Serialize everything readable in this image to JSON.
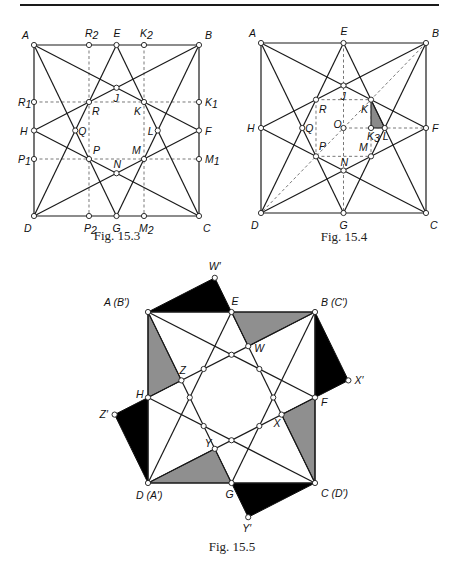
{
  "page": {
    "rule": true
  },
  "figures": [
    {
      "id": "fig-15-3",
      "caption": "Fig. 15.3",
      "caption_pos": [
        117,
        237
      ],
      "square": {
        "x0": 34,
        "y0": 45,
        "x1": 199,
        "y1": 216
      },
      "points": {
        "A": [
          0,
          0
        ],
        "B": [
          1,
          0
        ],
        "C": [
          1,
          1
        ],
        "D": [
          0,
          1
        ],
        "E": [
          0.5,
          0
        ],
        "F": [
          1,
          0.5
        ],
        "G": [
          0.5,
          1
        ],
        "H": [
          0,
          0.5
        ],
        "J": [
          0.5,
          0.25
        ],
        "K": [
          0.6667,
          0.3333
        ],
        "L": [
          0.75,
          0.5
        ],
        "M": [
          0.6667,
          0.6667
        ],
        "N": [
          0.5,
          0.75
        ],
        "P": [
          0.3333,
          0.6667
        ],
        "Q": [
          0.25,
          0.5
        ],
        "R": [
          0.3333,
          0.3333
        ],
        "R1": [
          0,
          0.3333
        ],
        "R2": [
          0.3333,
          0
        ],
        "K1": [
          1,
          0.3333
        ],
        "K2": [
          0.6667,
          0
        ],
        "P1": [
          0,
          0.6667
        ],
        "P2": [
          0.3333,
          1
        ],
        "M1": [
          1,
          0.6667
        ],
        "M2": [
          0.6667,
          1
        ]
      },
      "solid_lines": [
        [
          "A",
          "B"
        ],
        [
          "B",
          "C"
        ],
        [
          "C",
          "D"
        ],
        [
          "D",
          "A"
        ],
        [
          "A",
          "F"
        ],
        [
          "A",
          "G"
        ],
        [
          "B",
          "H"
        ],
        [
          "B",
          "G"
        ],
        [
          "C",
          "E"
        ],
        [
          "C",
          "H"
        ],
        [
          "D",
          "E"
        ],
        [
          "D",
          "F"
        ]
      ],
      "dashed_lines": [
        [
          "R1",
          "K1"
        ],
        [
          "P1",
          "M1"
        ],
        [
          "R2",
          "P2"
        ],
        [
          "K2",
          "M2"
        ]
      ],
      "circles": [
        "A",
        "B",
        "C",
        "D",
        "E",
        "F",
        "G",
        "H",
        "J",
        "K",
        "L",
        "M",
        "N",
        "P",
        "Q",
        "R",
        "R1",
        "R2",
        "K1",
        "K2",
        "P1",
        "P2",
        "M1",
        "M2"
      ],
      "shaded": [],
      "labels": [
        {
          "text": "A",
          "at": "A",
          "dx": -12,
          "dy": -6
        },
        {
          "text": "R",
          "sub": "2",
          "at": "R2",
          "dx": -4,
          "dy": -8
        },
        {
          "text": "E",
          "at": "E",
          "dx": -3,
          "dy": -8
        },
        {
          "text": "K",
          "sub": "2",
          "at": "K2",
          "dx": -4,
          "dy": -8
        },
        {
          "text": "B",
          "at": "B",
          "dx": 6,
          "dy": -6
        },
        {
          "text": "R",
          "sub": "1",
          "at": "R1",
          "dx": -16,
          "dy": 4
        },
        {
          "text": "K",
          "sub": "1",
          "at": "K1",
          "dx": 6,
          "dy": 4
        },
        {
          "text": "H",
          "at": "H",
          "dx": -14,
          "dy": 4
        },
        {
          "text": "F",
          "at": "F",
          "dx": 6,
          "dy": 4
        },
        {
          "text": "P",
          "sub": "1",
          "at": "P1",
          "dx": -16,
          "dy": 4
        },
        {
          "text": "M",
          "sub": "1",
          "at": "M1",
          "dx": 6,
          "dy": 4
        },
        {
          "text": "D",
          "at": "D",
          "dx": -10,
          "dy": 16
        },
        {
          "text": "P",
          "sub": "2",
          "at": "P2",
          "dx": -5,
          "dy": 16
        },
        {
          "text": "G",
          "at": "G",
          "dx": -4,
          "dy": 16
        },
        {
          "text": "M",
          "sub": "2",
          "at": "M2",
          "dx": -5,
          "dy": 16
        },
        {
          "text": "C",
          "at": "C",
          "dx": 4,
          "dy": 16
        },
        {
          "text": "J",
          "at": "J",
          "dx": -3,
          "dy": 14
        },
        {
          "text": "R",
          "at": "R",
          "dx": 3,
          "dy": 13
        },
        {
          "text": "K",
          "at": "K",
          "dx": -10,
          "dy": 13
        },
        {
          "text": "Q",
          "at": "Q",
          "dx": 3,
          "dy": 4
        },
        {
          "text": "L",
          "at": "L",
          "dx": -10,
          "dy": 4
        },
        {
          "text": "P",
          "at": "P",
          "dx": 4,
          "dy": -5
        },
        {
          "text": "M",
          "at": "M",
          "dx": -12,
          "dy": -5
        },
        {
          "text": "N",
          "at": "N",
          "dx": -3,
          "dy": -5
        }
      ]
    },
    {
      "id": "fig-15-4",
      "caption": "Fig. 15.4",
      "caption_pos": [
        344,
        238
      ],
      "square": {
        "x0": 261,
        "y0": 43,
        "x1": 426,
        "y1": 213
      },
      "points": {
        "A": [
          0,
          0
        ],
        "B": [
          1,
          0
        ],
        "C": [
          1,
          1
        ],
        "D": [
          0,
          1
        ],
        "E": [
          0.5,
          0
        ],
        "F": [
          1,
          0.5
        ],
        "G": [
          0.5,
          1
        ],
        "H": [
          0,
          0.5
        ],
        "J": [
          0.5,
          0.25
        ],
        "K": [
          0.6667,
          0.3333
        ],
        "L": [
          0.75,
          0.5
        ],
        "M": [
          0.6667,
          0.6667
        ],
        "N": [
          0.5,
          0.75
        ],
        "P": [
          0.3333,
          0.6667
        ],
        "Q": [
          0.25,
          0.5
        ],
        "R": [
          0.3333,
          0.3333
        ],
        "O": [
          0.5,
          0.5
        ],
        "K3": [
          0.6667,
          0.5
        ]
      },
      "solid_lines": [
        [
          "A",
          "B"
        ],
        [
          "B",
          "C"
        ],
        [
          "C",
          "D"
        ],
        [
          "D",
          "A"
        ],
        [
          "A",
          "F"
        ],
        [
          "A",
          "G"
        ],
        [
          "B",
          "H"
        ],
        [
          "B",
          "G"
        ],
        [
          "C",
          "E"
        ],
        [
          "C",
          "H"
        ],
        [
          "D",
          "E"
        ],
        [
          "D",
          "F"
        ]
      ],
      "dashed_lines": [
        [
          "E",
          "G"
        ],
        [
          "R",
          "K"
        ],
        [
          "R",
          "P"
        ],
        [
          "P",
          "M"
        ],
        [
          "K",
          "M"
        ],
        [
          "O",
          "F"
        ],
        [
          "B",
          "D"
        ]
      ],
      "circles": [
        "A",
        "B",
        "C",
        "D",
        "E",
        "F",
        "G",
        "H",
        "J",
        "K",
        "L",
        "M",
        "N",
        "P",
        "Q",
        "R",
        "O",
        "K3"
      ],
      "shaded": [
        {
          "pts": [
            "K",
            "K3",
            "L"
          ],
          "fill": "#8a8a8a"
        }
      ],
      "labels": [
        {
          "text": "A",
          "at": "A",
          "dx": -12,
          "dy": -6
        },
        {
          "text": "E",
          "at": "E",
          "dx": -3,
          "dy": -8
        },
        {
          "text": "B",
          "at": "B",
          "dx": 6,
          "dy": -6
        },
        {
          "text": "H",
          "at": "H",
          "dx": -14,
          "dy": 4
        },
        {
          "text": "F",
          "at": "F",
          "dx": 6,
          "dy": 4
        },
        {
          "text": "D",
          "at": "D",
          "dx": -10,
          "dy": 16
        },
        {
          "text": "G",
          "at": "G",
          "dx": -4,
          "dy": 16
        },
        {
          "text": "C",
          "at": "C",
          "dx": 4,
          "dy": 16
        },
        {
          "text": "J",
          "at": "J",
          "dx": -3,
          "dy": 14
        },
        {
          "text": "R",
          "at": "R",
          "dx": 3,
          "dy": 13
        },
        {
          "text": "K",
          "at": "K",
          "dx": -10,
          "dy": 13
        },
        {
          "text": "Q",
          "at": "Q",
          "dx": 3,
          "dy": 4
        },
        {
          "text": "O",
          "at": "O",
          "dx": -10,
          "dy": 0
        },
        {
          "text": "K",
          "sub": "3",
          "at": "K3",
          "dx": -4,
          "dy": 12
        },
        {
          "text": "L",
          "at": "L",
          "dx": -2,
          "dy": 12
        },
        {
          "text": "P",
          "at": "P",
          "dx": 3,
          "dy": -6
        },
        {
          "text": "M",
          "at": "M",
          "dx": -12,
          "dy": -5
        },
        {
          "text": "N",
          "at": "N",
          "dx": -3,
          "dy": -5
        }
      ]
    },
    {
      "id": "fig-15-5",
      "caption": "Fig. 15.5",
      "caption_pos": [
        232,
        548
      ],
      "square": {
        "x0": 148,
        "y0": 312,
        "x1": 315,
        "y1": 483
      },
      "points": {
        "A": [
          0,
          0
        ],
        "B": [
          1,
          0
        ],
        "C": [
          1,
          1
        ],
        "D": [
          0,
          1
        ],
        "E": [
          0.5,
          0
        ],
        "F": [
          1,
          0.5
        ],
        "G": [
          0.5,
          1
        ],
        "H": [
          0,
          0.5
        ],
        "J": [
          0.5,
          0.25
        ],
        "K": [
          0.6667,
          0.3333
        ],
        "L": [
          0.75,
          0.5
        ],
        "M": [
          0.6667,
          0.6667
        ],
        "N": [
          0.5,
          0.75
        ],
        "P": [
          0.3333,
          0.6667
        ],
        "Q": [
          0.25,
          0.5
        ],
        "R": [
          0.3333,
          0.3333
        ],
        "W": [
          0.6,
          0.2
        ],
        "X": [
          0.8,
          0.6
        ],
        "Y": [
          0.4,
          0.8
        ],
        "Z": [
          0.2,
          0.4
        ],
        "W2": [
          0.4,
          -0.2
        ],
        "X2": [
          1.2,
          0.4
        ],
        "Y2": [
          0.6,
          1.2
        ],
        "Z2": [
          -0.2,
          0.6
        ]
      },
      "solid_lines": [
        [
          "A",
          "B"
        ],
        [
          "B",
          "C"
        ],
        [
          "C",
          "D"
        ],
        [
          "D",
          "A"
        ],
        [
          "A",
          "F"
        ],
        [
          "A",
          "G"
        ],
        [
          "B",
          "H"
        ],
        [
          "B",
          "G"
        ],
        [
          "C",
          "E"
        ],
        [
          "C",
          "H"
        ],
        [
          "D",
          "E"
        ],
        [
          "D",
          "F"
        ]
      ],
      "dashed_lines": [],
      "circles": [
        "A",
        "B",
        "C",
        "D",
        "E",
        "F",
        "G",
        "H",
        "J",
        "K",
        "L",
        "M",
        "N",
        "P",
        "Q",
        "R",
        "W",
        "X",
        "Y",
        "Z",
        "W2",
        "X2",
        "Y2",
        "Z2"
      ],
      "shaded": [
        {
          "pts": [
            "A",
            "H",
            "Z"
          ],
          "fill": "#8f8f8f"
        },
        {
          "pts": [
            "E",
            "B",
            "W"
          ],
          "fill": "#8f8f8f"
        },
        {
          "pts": [
            "B",
            "F",
            "X"
          ],
          "fill": "#8f8f8f",
          "skip": true
        },
        {
          "pts": [
            "F",
            "C",
            "X"
          ],
          "fill": "#8f8f8f"
        },
        {
          "pts": [
            "G",
            "D",
            "Y"
          ],
          "fill": "#8f8f8f"
        },
        {
          "pts": [
            "A",
            "E",
            "W2"
          ],
          "fill": "#000000"
        },
        {
          "pts": [
            "B",
            "F",
            "X2"
          ],
          "fill": "#000000"
        },
        {
          "pts": [
            "C",
            "G",
            "Y2"
          ],
          "fill": "#000000"
        },
        {
          "pts": [
            "D",
            "H",
            "Z2"
          ],
          "fill": "#000000"
        }
      ],
      "labels": [
        {
          "text": "A  (B′)",
          "at": "A",
          "dx": -44,
          "dy": -6
        },
        {
          "text": "W′",
          "at": "W2",
          "dx": -6,
          "dy": -8
        },
        {
          "text": "E",
          "at": "E",
          "dx": 0,
          "dy": -7
        },
        {
          "text": "B  (C′)",
          "at": "B",
          "dx": 6,
          "dy": -6
        },
        {
          "text": "W",
          "at": "W",
          "dx": 6,
          "dy": 6
        },
        {
          "text": "Z",
          "at": "Z",
          "dx": -2,
          "dy": -6
        },
        {
          "text": "H",
          "at": "H",
          "dx": -12,
          "dy": 0
        },
        {
          "text": "F",
          "at": "F",
          "dx": 6,
          "dy": 8
        },
        {
          "text": "X′",
          "at": "X2",
          "dx": 6,
          "dy": 4
        },
        {
          "text": "Z′",
          "at": "Z2",
          "dx": -15,
          "dy": 3
        },
        {
          "text": "X",
          "at": "X",
          "dx": -8,
          "dy": 12
        },
        {
          "text": "Y",
          "at": "Y",
          "dx": -10,
          "dy": -2
        },
        {
          "text": "D  (A′)",
          "at": "D",
          "dx": -12,
          "dy": 16
        },
        {
          "text": "G",
          "at": "G",
          "dx": -6,
          "dy": 15
        },
        {
          "text": "C  (D′)",
          "at": "C",
          "dx": 6,
          "dy": 14
        },
        {
          "text": "Y′",
          "at": "Y2",
          "dx": -6,
          "dy": 15
        }
      ]
    }
  ]
}
